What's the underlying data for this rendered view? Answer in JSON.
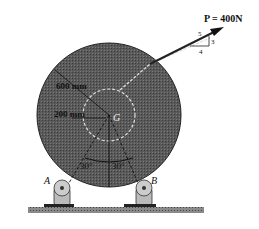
{
  "diagram": {
    "force": {
      "label": "P = 400N",
      "slope": {
        "hyp": "5",
        "rise": "3",
        "run": "4"
      }
    },
    "dimensions": {
      "outer_radius": "600 mm",
      "inner_radius": "200 mm"
    },
    "center": "G",
    "angles": [
      "30°",
      "30°"
    ],
    "supports": [
      "A",
      "B"
    ],
    "colors": {
      "disk": "#555555",
      "line": "#111111",
      "dash": "#dddddd"
    }
  }
}
